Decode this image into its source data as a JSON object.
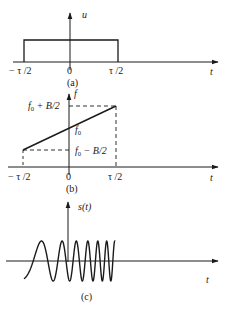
{
  "panels": {
    "a": {
      "caption": "(a)",
      "y_axis_label": "u",
      "x_axis_label": "t",
      "ticks": [
        "− τ /2",
        "0",
        "τ /2"
      ],
      "description": "Rectangular envelope of duration τ centered at 0"
    },
    "b": {
      "caption": "(b)",
      "y_axis_label": "f",
      "x_axis_label": "t",
      "ticks": [
        "− τ /2",
        "0",
        "τ /2"
      ],
      "upper_label_base": "f",
      "upper_label_sub": "0",
      "upper_label_rest": " + B/2",
      "center_label_base": "f",
      "center_label_sub": "0",
      "lower_label_base": "f",
      "lower_label_sub": "0",
      "lower_label_rest": " − B/2",
      "description": "Linear frequency ramp from f0−B/2 to f0+B/2"
    },
    "c": {
      "caption": "(c)",
      "y_axis_label": "s(t)",
      "x_axis_label": "t",
      "description": "Linear FM (chirp) signal with increasing frequency"
    }
  },
  "colors": {
    "ink": "#1a1a1a",
    "background": "#ffffff"
  }
}
